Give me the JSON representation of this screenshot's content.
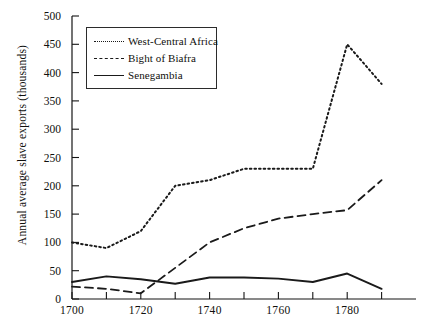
{
  "chart_data": {
    "type": "line",
    "title": "",
    "xlabel": "",
    "ylabel": "Annual average slave exports (thousands)",
    "xlim": [
      1700,
      1800
    ],
    "ylim": [
      0,
      500
    ],
    "grid": false,
    "legend_position": "top-left",
    "x_ticks": [
      1700,
      1720,
      1740,
      1760,
      1780
    ],
    "x_minor_ticks": [
      1710,
      1730,
      1750,
      1770,
      1790
    ],
    "y_ticks": [
      0,
      50,
      100,
      150,
      200,
      250,
      300,
      350,
      400,
      450,
      500
    ],
    "series": [
      {
        "name": "West-Central Africa",
        "style": "dotted",
        "color": "#1a1a1a",
        "x": [
          1700,
          1710,
          1720,
          1730,
          1740,
          1750,
          1760,
          1770,
          1780,
          1790
        ],
        "values": [
          100,
          90,
          120,
          200,
          210,
          230,
          230,
          230,
          450,
          380
        ]
      },
      {
        "name": "Bight of Biafra",
        "style": "dashed",
        "color": "#1a1a1a",
        "x": [
          1700,
          1710,
          1720,
          1730,
          1740,
          1750,
          1760,
          1770,
          1780,
          1790
        ],
        "values": [
          22,
          18,
          10,
          55,
          100,
          125,
          142,
          150,
          157,
          210
        ]
      },
      {
        "name": "Senegambia",
        "style": "solid",
        "color": "#1a1a1a",
        "x": [
          1700,
          1710,
          1720,
          1730,
          1740,
          1750,
          1760,
          1770,
          1780,
          1790
        ],
        "values": [
          30,
          40,
          35,
          27,
          38,
          38,
          36,
          30,
          45,
          18
        ]
      }
    ]
  },
  "axis": {
    "y_title": "Annual average slave exports (thousands)",
    "y_labels": [
      "500",
      "450",
      "400",
      "350",
      "300",
      "250",
      "200",
      "150",
      "100",
      "50",
      "0"
    ],
    "x_labels": [
      "1700",
      "1720",
      "1740",
      "1760",
      "1780"
    ]
  },
  "legend": {
    "items": [
      {
        "label": "West-Central Africa",
        "style": "dotted"
      },
      {
        "label": "Bight of Biafra",
        "style": "dashed"
      },
      {
        "label": "Senegambia",
        "style": "solid"
      }
    ]
  }
}
